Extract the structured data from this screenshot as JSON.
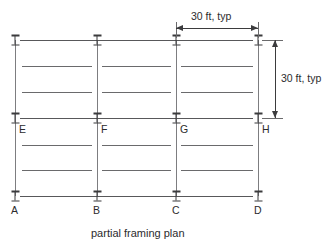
{
  "drawing": {
    "caption": "partial framing plan",
    "grid": {
      "column_x": [
        15,
        97,
        176,
        258
      ],
      "row_y": [
        40,
        118,
        196
      ],
      "bay_width_px": 82
    },
    "columns": [
      {
        "id": "A",
        "label": "A",
        "x": 15,
        "y": 196,
        "label_x": 11,
        "label_y": 203,
        "symbol": "i-beam-column"
      },
      {
        "id": "B",
        "label": "B",
        "x": 97,
        "y": 196,
        "label_x": 93,
        "label_y": 203,
        "symbol": "i-beam-column"
      },
      {
        "id": "C",
        "label": "C",
        "x": 176,
        "y": 196,
        "label_x": 172,
        "label_y": 203,
        "symbol": "i-beam-column"
      },
      {
        "id": "D",
        "label": "D",
        "x": 258,
        "y": 196,
        "label_x": 254,
        "label_y": 203,
        "symbol": "i-beam-column"
      },
      {
        "id": "E",
        "label": "E",
        "x": 15,
        "y": 118,
        "label_x": 19,
        "label_y": 124,
        "symbol": "i-beam-column"
      },
      {
        "id": "F",
        "label": "F",
        "x": 97,
        "y": 118,
        "label_x": 101,
        "label_y": 124,
        "symbol": "i-beam-column"
      },
      {
        "id": "G",
        "label": "G",
        "x": 176,
        "y": 118,
        "label_x": 180,
        "label_y": 124,
        "symbol": "i-beam-column"
      },
      {
        "id": "H",
        "label": "H",
        "x": 258,
        "y": 118,
        "label_x": 262,
        "label_y": 124,
        "symbol": "i-beam-column"
      },
      {
        "id": "top-1",
        "label": "",
        "x": 15,
        "y": 40,
        "label_x": 0,
        "label_y": 0,
        "symbol": "i-beam-column"
      },
      {
        "id": "top-2",
        "label": "",
        "x": 97,
        "y": 40,
        "label_x": 0,
        "label_y": 0,
        "symbol": "i-beam-column"
      },
      {
        "id": "top-3",
        "label": "",
        "x": 176,
        "y": 40,
        "label_x": 0,
        "label_y": 0,
        "symbol": "i-beam-column"
      },
      {
        "id": "top-4",
        "label": "",
        "x": 258,
        "y": 40,
        "label_x": 0,
        "label_y": 0,
        "symbol": "i-beam-column"
      }
    ],
    "girders_horizontal": [
      {
        "y": 40,
        "x1": 20,
        "x2": 253
      },
      {
        "y": 118,
        "x1": 20,
        "x2": 253
      },
      {
        "y": 196,
        "x1": 20,
        "x2": 253
      }
    ],
    "girders_vertical": [
      {
        "x": 15,
        "y1": 40,
        "y2": 196
      },
      {
        "x": 97,
        "y1": 40,
        "y2": 196
      },
      {
        "x": 176,
        "y1": 40,
        "y2": 196
      },
      {
        "x": 258,
        "y1": 40,
        "y2": 196
      }
    ],
    "joists": [
      {
        "y": 66,
        "x1": 22,
        "x2": 92
      },
      {
        "y": 92,
        "x1": 22,
        "x2": 92
      },
      {
        "y": 145,
        "x1": 22,
        "x2": 92
      },
      {
        "y": 170,
        "x1": 22,
        "x2": 92
      },
      {
        "y": 66,
        "x1": 102,
        "x2": 171
      },
      {
        "y": 92,
        "x1": 102,
        "x2": 171
      },
      {
        "y": 145,
        "x1": 102,
        "x2": 171
      },
      {
        "y": 170,
        "x1": 102,
        "x2": 171
      },
      {
        "y": 66,
        "x1": 181,
        "x2": 253
      },
      {
        "y": 92,
        "x1": 181,
        "x2": 253
      },
      {
        "y": 145,
        "x1": 181,
        "x2": 253
      },
      {
        "y": 170,
        "x1": 181,
        "x2": 253
      }
    ],
    "dimensions": {
      "horizontal": {
        "text": "30 ft, typ",
        "text_x": 191,
        "text_y": 11,
        "line_y": 28,
        "x1": 176,
        "x2": 258,
        "ext_left_x": 176,
        "ext_right_x": 258,
        "ext_y1": 22,
        "ext_y2": 36
      },
      "vertical": {
        "text": "30 ft, typ",
        "text_x": 281,
        "text_y": 73,
        "line_x": 275,
        "y1": 40,
        "y2": 118,
        "ext_top_y": 40,
        "ext_bottom_y": 118,
        "ext_x1": 262,
        "ext_x2": 283
      }
    },
    "caption_pos": {
      "x": 91,
      "y": 226
    }
  }
}
